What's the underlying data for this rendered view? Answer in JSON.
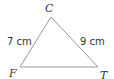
{
  "diagram": {
    "type": "triangle",
    "vertices": [
      {
        "name": "C",
        "x": 51,
        "y": 17
      },
      {
        "name": "F",
        "x": 20,
        "y": 67
      },
      {
        "name": "T",
        "x": 98,
        "y": 67
      }
    ],
    "sides": [
      {
        "from": "C",
        "to": "F",
        "length_label": "7 cm"
      },
      {
        "from": "C",
        "to": "T",
        "length_label": "9 cm"
      },
      {
        "from": "F",
        "to": "T",
        "length_label": ""
      }
    ],
    "line_color": "#999999",
    "text_color": "#333333"
  },
  "labels": {
    "vertex_c": "C",
    "vertex_f": "F",
    "vertex_t": "T",
    "side_cf": "7 cm",
    "side_ct": "9 cm"
  }
}
